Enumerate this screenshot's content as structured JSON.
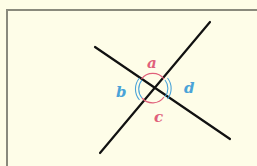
{
  "diagram": {
    "type": "intersecting-lines-angles",
    "labels": {
      "a": "a",
      "b": "b",
      "c": "c",
      "d": "d"
    },
    "colors": {
      "background": "#fefde6",
      "frame_border": "#8a8a7c",
      "lines": "#111111",
      "pair_ac": "#e0607a",
      "pair_bd": "#4aa3d8"
    }
  }
}
